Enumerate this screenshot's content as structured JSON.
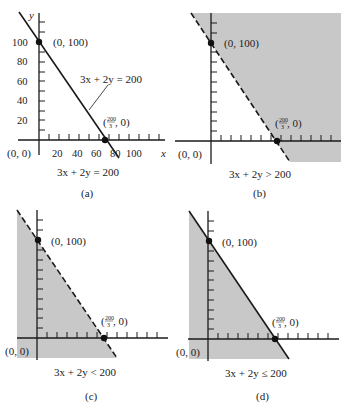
{
  "figure": {
    "shade_color": "#c8c8c8",
    "line_color": "#1a1a1a",
    "panels": [
      {
        "id": "a",
        "caption": "(a)",
        "equation": "3x + 2y = 200",
        "line_label": "3x + 2y = 200",
        "line_style": "solid",
        "shading": "none",
        "origin_label": "(0, 0)",
        "y_intercept_label": "(0, 100)",
        "x_intercept_label_num": "200",
        "x_intercept_label_den": "3",
        "x_intercept_label_suffix": ", 0)",
        "x_intercept_label_prefix": "(",
        "x_axis_label": "x",
        "y_axis_label": "y",
        "x_ticks": [
          "20",
          "40",
          "60",
          "80",
          "100"
        ],
        "y_ticks": [
          "20",
          "40",
          "60",
          "80",
          "100"
        ]
      },
      {
        "id": "b",
        "caption": "(b)",
        "equation": "3x + 2y > 200",
        "line_style": "dashed",
        "shading": "above",
        "origin_label": "(0, 0)",
        "y_intercept_label": "(0, 100)",
        "x_intercept_label_num": "200",
        "x_intercept_label_den": "3",
        "x_intercept_label_prefix": "(",
        "x_intercept_label_suffix": ", 0)"
      },
      {
        "id": "c",
        "caption": "(c)",
        "equation": "3x + 2y < 200",
        "line_style": "dashed",
        "shading": "below",
        "origin_label": "(0, 0)",
        "y_intercept_label": "(0, 100)",
        "x_intercept_label_num": "200",
        "x_intercept_label_den": "3",
        "x_intercept_label_prefix": "(",
        "x_intercept_label_suffix": ", 0)"
      },
      {
        "id": "d",
        "caption": "(d)",
        "equation": "3x + 2y ≤ 200",
        "line_style": "solid",
        "shading": "below",
        "origin_label": "(0, 0)",
        "y_intercept_label": "(0, 100)",
        "x_intercept_label_num": "200",
        "x_intercept_label_den": "3",
        "x_intercept_label_prefix": "(",
        "x_intercept_label_suffix": ", 0)"
      }
    ]
  }
}
